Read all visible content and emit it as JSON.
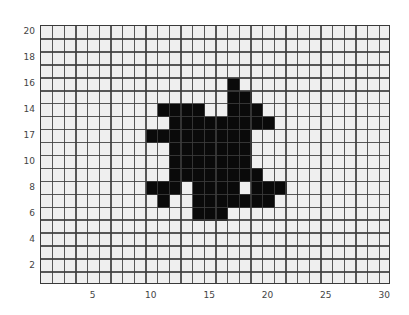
{
  "chart_data": {
    "type": "heatmap",
    "subtype": "binary occupancy grid",
    "title": "",
    "xlabel": "",
    "ylabel": "",
    "xlim": [
      0.5,
      30.5
    ],
    "ylim": [
      0.5,
      20.5
    ],
    "grid": true,
    "legend": null,
    "columns": 30,
    "rows": 20,
    "background_color": "#efefef",
    "fill_color": "#0a0a0a",
    "grid_color": "#3c3c3c",
    "x_ticks": [
      {
        "value": 5,
        "label": "5"
      },
      {
        "value": 10,
        "label": "10"
      },
      {
        "value": 15,
        "label": "15"
      },
      {
        "value": 20,
        "label": "20"
      },
      {
        "value": 25,
        "label": "25"
      },
      {
        "value": 30,
        "label": "30"
      }
    ],
    "y_ticks": [
      {
        "value": 2,
        "label": "2"
      },
      {
        "value": 4,
        "label": "4"
      },
      {
        "value": 6,
        "label": "6"
      },
      {
        "value": 8,
        "label": "8"
      },
      {
        "value": 10,
        "label": "10"
      },
      {
        "value": 12,
        "label": "17"
      },
      {
        "value": 14,
        "label": "14"
      },
      {
        "value": 16,
        "label": "16"
      },
      {
        "value": 18,
        "label": "18"
      },
      {
        "value": 20,
        "label": "20"
      }
    ],
    "filled_cells_by_row": [
      {
        "y": 16,
        "x": [
          17
        ]
      },
      {
        "y": 15,
        "x": [
          17,
          18
        ]
      },
      {
        "y": 14,
        "x": [
          11,
          12,
          13,
          14,
          17,
          18,
          19
        ]
      },
      {
        "y": 13,
        "x": [
          12,
          13,
          14,
          15,
          16,
          17,
          18,
          19,
          20
        ]
      },
      {
        "y": 12,
        "x": [
          10,
          11,
          12,
          13,
          14,
          15,
          16,
          17,
          18
        ]
      },
      {
        "y": 11,
        "x": [
          12,
          13,
          14,
          15,
          16,
          17,
          18
        ]
      },
      {
        "y": 10,
        "x": [
          12,
          13,
          14,
          15,
          16,
          17,
          18
        ]
      },
      {
        "y": 9,
        "x": [
          12,
          13,
          14,
          15,
          16,
          17,
          18,
          19
        ]
      },
      {
        "y": 8,
        "x": [
          10,
          11,
          12,
          14,
          15,
          16,
          17,
          19,
          20,
          21
        ]
      },
      {
        "y": 7,
        "x": [
          11,
          14,
          15,
          16,
          17,
          18,
          19,
          20
        ]
      },
      {
        "y": 6,
        "x": [
          14,
          15,
          16
        ]
      }
    ],
    "filled_cell_count": 70
  }
}
